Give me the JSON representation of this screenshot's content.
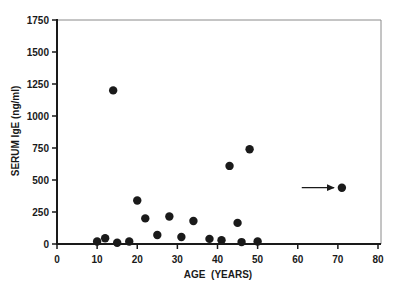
{
  "chart_data": {
    "type": "scatter",
    "title": "",
    "xlabel": "AGE  (YEARS)",
    "ylabel": "SERUM IgE (ng/ml)",
    "xlim": [
      0,
      80
    ],
    "ylim": [
      0,
      1750
    ],
    "xticks": [
      0,
      10,
      20,
      30,
      40,
      50,
      60,
      70,
      80
    ],
    "yticks": [
      0,
      250,
      500,
      750,
      1000,
      1250,
      1500,
      1750
    ],
    "grid": false,
    "legend": null,
    "series": [
      {
        "name": "patients",
        "marker": "filled-circle",
        "color": "#1a1a1a",
        "points": [
          {
            "x": 10,
            "y": 20
          },
          {
            "x": 12,
            "y": 45
          },
          {
            "x": 14,
            "y": 1200
          },
          {
            "x": 15,
            "y": 10
          },
          {
            "x": 18,
            "y": 20
          },
          {
            "x": 20,
            "y": 340
          },
          {
            "x": 22,
            "y": 200
          },
          {
            "x": 25,
            "y": 70
          },
          {
            "x": 28,
            "y": 215
          },
          {
            "x": 31,
            "y": 55
          },
          {
            "x": 34,
            "y": 180
          },
          {
            "x": 38,
            "y": 40
          },
          {
            "x": 41,
            "y": 30
          },
          {
            "x": 43,
            "y": 610
          },
          {
            "x": 45,
            "y": 165
          },
          {
            "x": 46,
            "y": 15
          },
          {
            "x": 48,
            "y": 740
          },
          {
            "x": 50,
            "y": 20
          },
          {
            "x": 71,
            "y": 440
          }
        ]
      }
    ],
    "annotations": [
      {
        "type": "arrow",
        "from": {
          "x": 61,
          "y": 440
        },
        "to": {
          "x": 69,
          "y": 440
        },
        "points_to": {
          "x": 71,
          "y": 440
        }
      }
    ]
  }
}
